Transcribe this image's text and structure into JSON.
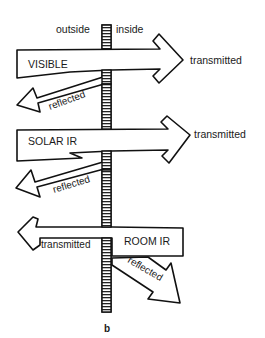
{
  "diagram": {
    "type": "radiation-through-window",
    "sublabel": "b",
    "wall": {
      "left_label": "outside",
      "right_label": "inside"
    },
    "arrows": [
      {
        "name": "VISIBLE",
        "label": "VISIBLE",
        "direction": "outside-to-inside",
        "transmitted_label": "transmitted",
        "reflected_label": "reflected"
      },
      {
        "name": "SOLAR IR",
        "label": "SOLAR IR",
        "direction": "outside-to-inside",
        "transmitted_label": "transmitted",
        "reflected_label": "reflected"
      },
      {
        "name": "ROOM IR",
        "label": "ROOM IR",
        "direction": "inside-to-outside",
        "transmitted_label": "transmitted",
        "reflected_label": "reflected"
      }
    ]
  },
  "colors": {
    "line": "#111111",
    "background": "#ffffff",
    "text": "#1a1a1a"
  }
}
